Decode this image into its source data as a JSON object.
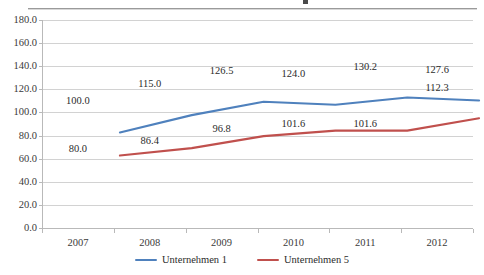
{
  "chart_data": {
    "type": "line",
    "title": "",
    "subtitle": "",
    "xlabel": "",
    "ylabel": "",
    "categories": [
      "2007",
      "2008",
      "2009",
      "2010",
      "2011",
      "2012"
    ],
    "ylim": [
      0.0,
      180.0
    ],
    "y_ticks": [
      "0.0",
      "20.0",
      "40.0",
      "60.0",
      "80.0",
      "100.0",
      "120.0",
      "140.0",
      "160.0",
      "180.0"
    ],
    "y_tick_values": [
      0.0,
      20.0,
      40.0,
      60.0,
      80.0,
      100.0,
      120.0,
      140.0,
      160.0,
      180.0
    ],
    "grid": "horizontal",
    "legend_position": "bottom-center",
    "markers": false,
    "series": [
      {
        "name": "Unternehmen 1",
        "color": "#4F81BD",
        "values": [
          100.0,
          115.0,
          126.5,
          124.0,
          130.2,
          127.6
        ],
        "labels": [
          "100.0",
          "115.0",
          "126.5",
          "124.0",
          "130.2",
          "127.6"
        ],
        "label_position": "above"
      },
      {
        "name": "Unternehmen 5",
        "color": "#C0504D",
        "values": [
          80.0,
          86.4,
          96.8,
          101.6,
          101.6,
          112.3
        ],
        "labels": [
          "80.0",
          "86.4",
          "96.8",
          "101.6",
          "101.6",
          "112.3"
        ],
        "label_position": "below"
      }
    ]
  },
  "legend": {
    "items": [
      {
        "label": "Unternehmen 1",
        "color": "#4F81BD"
      },
      {
        "label": "Unternehmen 5",
        "color": "#C0504D"
      }
    ]
  },
  "colors": {
    "series_1": "#4F81BD",
    "series_2": "#C0504D",
    "gridline": "#D2D2D2",
    "axis": "#B9B9B9",
    "text": "#2B2B2B",
    "background": "#FFFFFF"
  }
}
